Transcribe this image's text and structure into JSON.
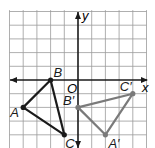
{
  "diagram": {
    "type": "coordinate-plane-transformation",
    "axes": {
      "x_label": "x",
      "y_label": "y",
      "origin_label": "O"
    },
    "grid": {
      "x_min": -5,
      "x_max": 5,
      "y_min": -5,
      "y_max": 5
    },
    "colors": {
      "grid": "#9a9a9a",
      "axis": "#1a1a1a",
      "original": "#1a1a1a",
      "image": "#7a7a7a"
    },
    "original_triangle": {
      "vertices": [
        {
          "label": "A",
          "x": -4,
          "y": -2
        },
        {
          "label": "B",
          "x": -2,
          "y": 0
        },
        {
          "label": "C",
          "x": -1,
          "y": -4
        }
      ]
    },
    "image_triangle": {
      "vertices": [
        {
          "label": "A′",
          "x": 2,
          "y": -4
        },
        {
          "label": "B′",
          "x": 0,
          "y": -2
        },
        {
          "label": "C′",
          "x": 4,
          "y": -1
        }
      ]
    }
  }
}
